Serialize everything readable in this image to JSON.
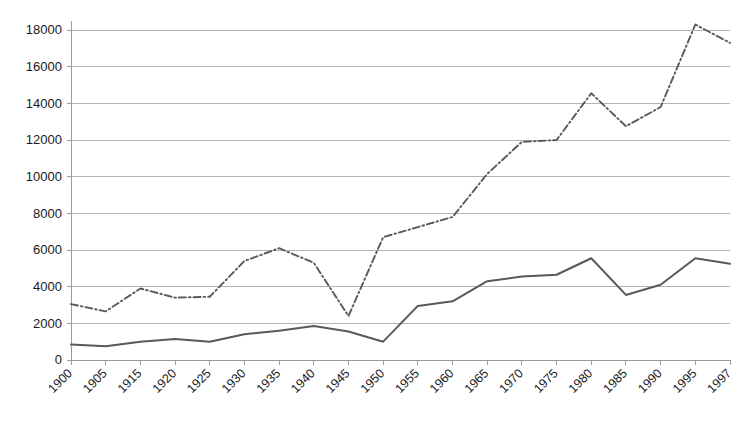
{
  "chart_data": {
    "type": "line",
    "title": "",
    "subtitle": "",
    "xlabel": "",
    "ylabel": "",
    "grid": true,
    "legend_position": "none",
    "ylim": [
      0,
      18000
    ],
    "ytick_labels": [
      "0",
      "2000",
      "4000",
      "6000",
      "8000",
      "10000",
      "12000",
      "14000",
      "16000",
      "18000"
    ],
    "ytick_values": [
      0,
      2000,
      4000,
      6000,
      8000,
      10000,
      12000,
      14000,
      16000,
      18000
    ],
    "categories": [
      "1900",
      "1905",
      "1915",
      "1920",
      "1925",
      "1930",
      "1935",
      "1940",
      "1945",
      "1950",
      "1955",
      "1960",
      "1965",
      "1970",
      "1975",
      "1980",
      "1985",
      "1990",
      "1995",
      "1997"
    ],
    "series": [
      {
        "name": "series-1",
        "style": "dash-dot",
        "color": "#595959",
        "values": [
          3050,
          2650,
          3900,
          3400,
          3450,
          5400,
          6100,
          5300,
          2400,
          6700,
          7250,
          7800,
          10150,
          11900,
          12000,
          14550,
          12750,
          13800,
          18300,
          17300
        ]
      },
      {
        "name": "series-2",
        "style": "solid",
        "color": "#595959",
        "values": [
          850,
          750,
          1000,
          1150,
          1000,
          1400,
          1600,
          1850,
          1550,
          1000,
          2950,
          3200,
          4300,
          4550,
          4650,
          5550,
          3550,
          4100,
          5550,
          5250
        ]
      }
    ]
  },
  "plot": {
    "left": 71,
    "right": 730,
    "top": 30,
    "bottom": 360
  }
}
